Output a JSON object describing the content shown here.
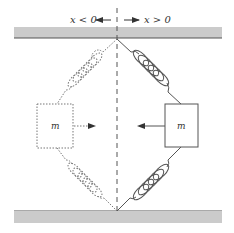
{
  "diagram": {
    "labels": {
      "left_region": "x < 0",
      "right_region": "x > 0",
      "left_mass": "m",
      "right_mass": "m"
    },
    "colors": {
      "wall_fill": "#c8c8c8",
      "wall_edge": "#555555",
      "line": "#555555",
      "dotted": "#777777"
    },
    "elements": {
      "top_wall": "fixed wall (top)",
      "bottom_wall": "fixed wall (bottom)",
      "center_axis": "dashed vertical axis x = 0",
      "left_mass_state": "displaced (dotted outline) at x < 0",
      "right_mass_state": "displaced (solid outline) at x > 0",
      "left_force_arrow": "points right toward equilibrium",
      "right_force_arrow": "points left toward equilibrium"
    }
  }
}
